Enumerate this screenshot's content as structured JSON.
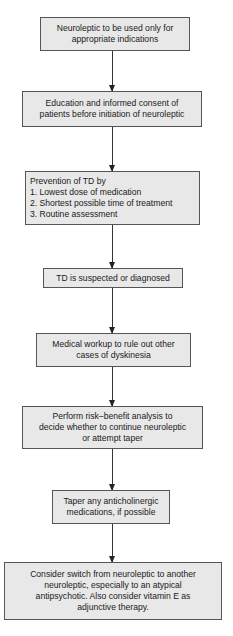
{
  "flowchart": {
    "steps": [
      {
        "id": "appropriate-indications",
        "text": "Neuroleptic to be used only for\nappropriate indications"
      },
      {
        "id": "education-consent",
        "text": "Education and informed consent of\npatients before initiation of neuroleptic"
      },
      {
        "id": "prevention",
        "text": "Prevention of TD by\n1. Lowest dose of medication\n2. Shortest possible time of treatment\n3. Routine assessment"
      },
      {
        "id": "td-suspected",
        "text": "TD is suspected or diagnosed"
      },
      {
        "id": "medical-workup",
        "text": "Medical workup to rule out other\ncases of dyskinesia"
      },
      {
        "id": "risk-benefit",
        "text": "Perform risk–benefit analysis to\ndecide whether to continue neuroleptic\nor attempt taper"
      },
      {
        "id": "taper-anticholinergic",
        "text": "Taper any anticholinergic\nmedications, if possible"
      },
      {
        "id": "consider-switch",
        "text": "Consider switch from neuroleptic to another\nneuroleptic, especially to an atypical\nantipsychotic. Also consider vitamin E as\nadjunctive therapy."
      }
    ],
    "colors": {
      "box_fill": "#e8e8e8",
      "box_border": "#555555",
      "arrow": "#333333"
    }
  }
}
